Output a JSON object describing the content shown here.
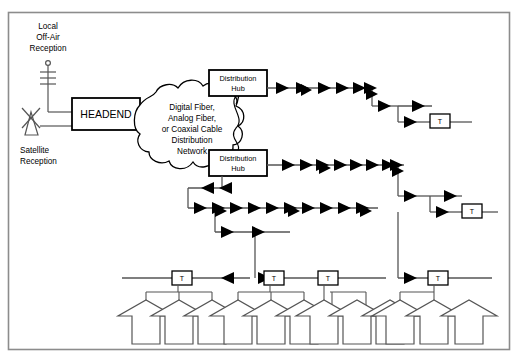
{
  "diagram": {
    "frame": {
      "stroke": "#8c8c8c",
      "x": 8,
      "y": 12,
      "w": 502,
      "h": 338
    },
    "colors": {
      "line": "#5a5a5a",
      "line_dark": "#000000",
      "amplifier_fill": "#000000",
      "box_stroke": "#000000",
      "text": "#000000",
      "background": "#ffffff",
      "frame": "#8c8c8c"
    },
    "sources": [
      {
        "id": "offair",
        "label_lines": [
          "Local",
          "Off-Air",
          "Reception"
        ],
        "icon": "yagi-antenna-icon",
        "x": 44,
        "y": 22
      },
      {
        "id": "satellite",
        "label_lines": [
          "Satellite",
          "Reception"
        ],
        "icon": "satellite-dish-icon",
        "x": 44,
        "y": 148
      }
    ],
    "headend": {
      "label": "HEADEND",
      "x": 72,
      "y": 98,
      "w": 68,
      "h": 32
    },
    "cloud": {
      "label_lines": [
        "Digital Fiber,",
        "Analog Fiber,",
        "or Coaxial Cable",
        "Distribution",
        "Network"
      ],
      "center_x": 192,
      "center_y": 126
    },
    "hubs": [
      {
        "id": "hub1",
        "label_lines": [
          "Distribution",
          "Hub"
        ],
        "x": 209,
        "y": 70,
        "w": 58,
        "h": 26
      },
      {
        "id": "hub2",
        "label_lines": [
          "Distribution",
          "Hub"
        ],
        "x": 209,
        "y": 150,
        "w": 58,
        "h": 26
      }
    ],
    "taps": [
      {
        "id": "tap-r1",
        "label": "T",
        "x": 434,
        "y": 118
      },
      {
        "id": "tap-r2",
        "label": "T",
        "x": 466,
        "y": 208
      },
      {
        "id": "tap-h1",
        "label": "T",
        "x": 182,
        "y": 275
      },
      {
        "id": "tap-h2",
        "label": "T",
        "x": 274,
        "y": 275
      },
      {
        "id": "tap-h3",
        "label": "T",
        "x": 328,
        "y": 275
      },
      {
        "id": "tap-h4",
        "label": "T",
        "x": 438,
        "y": 275
      }
    ],
    "house_count": 12,
    "trunk_amplifier_counts": {
      "trunk_1": 8,
      "trunk_2": 9,
      "trunk_3": 11
    },
    "legend_note": ""
  }
}
